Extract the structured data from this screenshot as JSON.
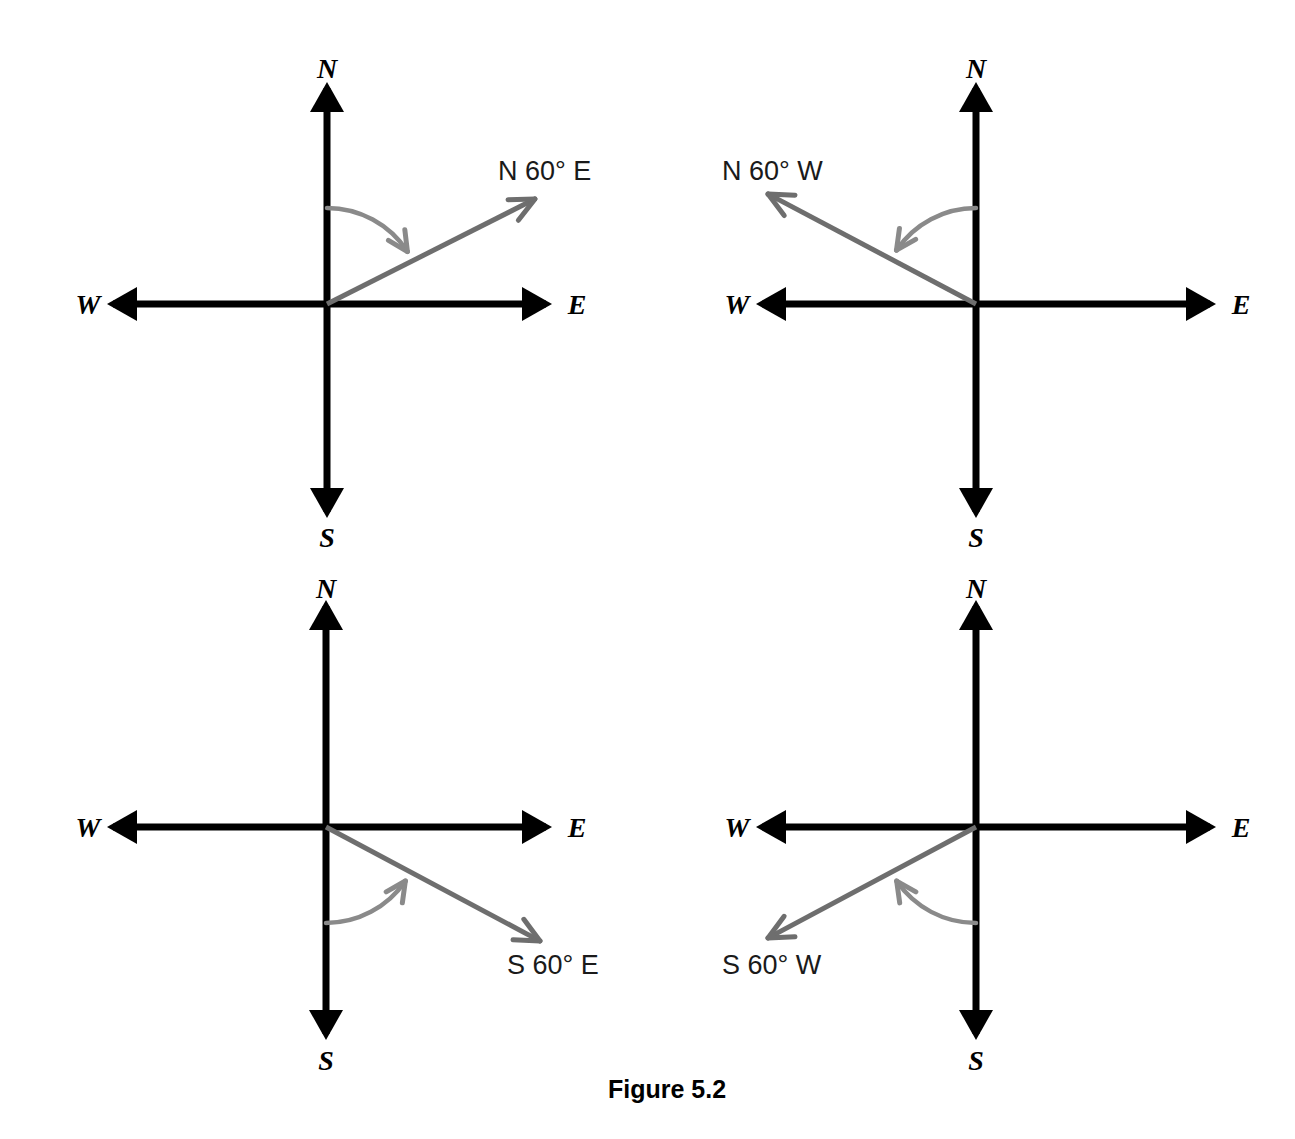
{
  "figure": {
    "caption": "Figure 5.2",
    "caption_x": 667,
    "caption_y": 1098,
    "background_color": "#ffffff",
    "axis_color": "#000000",
    "ray_color": "#6e6e6e",
    "arc_color": "#8a8a8a",
    "text_color": "#1a1a1a"
  },
  "compass_points": {
    "north": "N",
    "south": "S",
    "east": "E",
    "west": "W"
  },
  "diagrams": [
    {
      "id": "bearing-n60e",
      "position": "top-left",
      "bearing_label": "N 60° E",
      "label_x": 498,
      "label_y": 180,
      "origin_x": 327,
      "origin_y": 304,
      "axis_north_y": 82,
      "axis_south_y": 518,
      "axis_west_x": 107,
      "axis_east_x": 552,
      "north_label_x": 327,
      "north_label_y": 78,
      "south_label_x": 327,
      "south_label_y": 547,
      "west_label_x": 88,
      "west_label_y": 314,
      "east_label_x": 577,
      "east_label_y": 314,
      "ray_tip_x": 535,
      "ray_tip_y": 199,
      "ray_angle_deg": 60,
      "ray_from": "N",
      "ray_toward": "E",
      "arc_from": "N-axis",
      "arc_to": "ray",
      "arc_radius": 96,
      "angle_value": 60,
      "angle_unit": "°"
    },
    {
      "id": "bearing-n60w",
      "position": "top-right",
      "bearing_label": "N 60° W",
      "label_x": 722,
      "label_y": 180,
      "origin_x": 976,
      "origin_y": 304,
      "axis_north_y": 82,
      "axis_south_y": 518,
      "axis_west_x": 756,
      "axis_east_x": 1216,
      "north_label_x": 976,
      "north_label_y": 78,
      "south_label_x": 976,
      "south_label_y": 547,
      "west_label_x": 737,
      "west_label_y": 314,
      "east_label_x": 1241,
      "east_label_y": 314,
      "ray_tip_x": 768,
      "ray_tip_y": 194,
      "ray_angle_deg": 60,
      "ray_from": "N",
      "ray_toward": "W",
      "arc_from": "N-axis",
      "arc_to": "ray",
      "arc_radius": 96,
      "angle_value": 60,
      "angle_unit": "°"
    },
    {
      "id": "bearing-s60e",
      "position": "bottom-left",
      "bearing_label": "S 60° E",
      "label_x": 507,
      "label_y": 974,
      "origin_x": 326,
      "origin_y": 827,
      "axis_north_y": 600,
      "axis_south_y": 1040,
      "axis_west_x": 107,
      "axis_east_x": 552,
      "north_label_x": 326,
      "north_label_y": 598,
      "south_label_x": 326,
      "south_label_y": 1070,
      "west_label_x": 88,
      "west_label_y": 837,
      "east_label_x": 577,
      "east_label_y": 837,
      "ray_tip_x": 540,
      "ray_tip_y": 941,
      "ray_angle_deg": 60,
      "ray_from": "S",
      "ray_toward": "E",
      "arc_from": "S-axis",
      "arc_to": "ray",
      "arc_radius": 96,
      "angle_value": 60,
      "angle_unit": "°"
    },
    {
      "id": "bearing-s60w",
      "position": "bottom-right",
      "bearing_label": "S 60° W",
      "label_x": 722,
      "label_y": 974,
      "origin_x": 976,
      "origin_y": 827,
      "axis_north_y": 600,
      "axis_south_y": 1040,
      "axis_west_x": 756,
      "axis_east_x": 1216,
      "north_label_x": 976,
      "north_label_y": 598,
      "south_label_x": 976,
      "south_label_y": 1070,
      "west_label_x": 737,
      "west_label_y": 837,
      "east_label_x": 1241,
      "east_label_y": 837,
      "ray_tip_x": 768,
      "ray_tip_y": 938,
      "ray_angle_deg": 60,
      "ray_from": "S",
      "ray_toward": "W",
      "arc_from": "S-axis",
      "arc_to": "ray",
      "arc_radius": 96,
      "angle_value": 60,
      "angle_unit": "°"
    }
  ],
  "chart_data": {
    "type": "diagram",
    "title": "Figure 5.2",
    "bearings": [
      {
        "label": "N 60° E",
        "reference": "N",
        "angle": 60,
        "direction": "E",
        "quadrant": "NE"
      },
      {
        "label": "N 60° W",
        "reference": "N",
        "angle": 60,
        "direction": "W",
        "quadrant": "NW"
      },
      {
        "label": "S 60° E",
        "reference": "S",
        "angle": 60,
        "direction": "E",
        "quadrant": "SE"
      },
      {
        "label": "S 60° W",
        "reference": "S",
        "angle": 60,
        "direction": "W",
        "quadrant": "SW"
      }
    ]
  }
}
